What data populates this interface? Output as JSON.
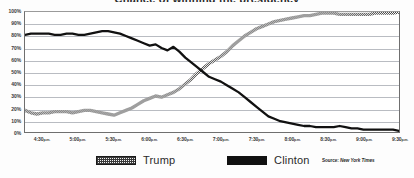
{
  "chart_data": {
    "type": "line",
    "title": "Chance of winning the presidency",
    "xlabel": "",
    "ylabel": "",
    "ylim": [
      0,
      100
    ],
    "ytick_labels": [
      "0%",
      "10%",
      "20%",
      "30%",
      "40%",
      "50%",
      "60%",
      "70%",
      "80%",
      "90%",
      "100%"
    ],
    "ytick_values": [
      0,
      10,
      20,
      30,
      40,
      50,
      60,
      70,
      80,
      90,
      100
    ],
    "grid": true,
    "legend_position": "bottom",
    "xtick_labels": [
      "4:30 p.m.",
      "5:00 p.m.",
      "5:30 p.m.",
      "6:00 p.m.",
      "6:30 p.m.",
      "7:00 p.m.",
      "7:30 p.m.",
      "8:00 p.m.",
      "8:30 p.m.",
      "9:00 p.m.",
      "9:30 p.m."
    ],
    "x": [
      "4:15",
      "4:20",
      "4:25",
      "4:30",
      "4:35",
      "4:40",
      "4:45",
      "4:50",
      "4:55",
      "5:00",
      "5:05",
      "5:10",
      "5:15",
      "5:20",
      "5:25",
      "5:30",
      "5:35",
      "5:40",
      "5:45",
      "5:50",
      "5:55",
      "6:00",
      "6:05",
      "6:10",
      "6:15",
      "6:20",
      "6:25",
      "6:30",
      "6:35",
      "6:40",
      "6:45",
      "6:50",
      "6:55",
      "7:00",
      "7:05",
      "7:10",
      "7:15",
      "7:20",
      "7:25",
      "7:30",
      "7:35",
      "7:40",
      "7:45",
      "7:50",
      "7:55",
      "8:00",
      "8:05",
      "8:10",
      "8:15",
      "8:20",
      "8:25",
      "8:30",
      "8:35",
      "8:40",
      "8:45",
      "8:50",
      "8:55",
      "9:00",
      "9:05",
      "9:10",
      "9:15",
      "9:20",
      "9:25",
      "9:30"
    ],
    "series": [
      {
        "name": "Trump",
        "color": "#555555",
        "style": "dotted-thick",
        "values": [
          18,
          16,
          15,
          16,
          16,
          17,
          17,
          17,
          16,
          17,
          18,
          18,
          17,
          16,
          15,
          14,
          16,
          18,
          20,
          23,
          26,
          28,
          30,
          29,
          31,
          33,
          36,
          40,
          44,
          49,
          53,
          57,
          60,
          63,
          67,
          72,
          76,
          80,
          83,
          86,
          88,
          90,
          92,
          93,
          94,
          95,
          96,
          97,
          97,
          98,
          99,
          99,
          99,
          98,
          98,
          98,
          98,
          98,
          98,
          99,
          99,
          99,
          99,
          100
        ]
      },
      {
        "name": "Clinton",
        "color": "#111111",
        "style": "solid-thick",
        "values": [
          81,
          82,
          82,
          82,
          82,
          81,
          81,
          82,
          82,
          81,
          81,
          82,
          83,
          84,
          84,
          83,
          82,
          80,
          78,
          76,
          74,
          72,
          73,
          70,
          68,
          71,
          67,
          62,
          58,
          54,
          50,
          46,
          44,
          42,
          39,
          36,
          33,
          29,
          25,
          21,
          17,
          13,
          11,
          9,
          8,
          7,
          6,
          5,
          5,
          4,
          4,
          4,
          4,
          5,
          4,
          3,
          3,
          2,
          2,
          2,
          2,
          2,
          2,
          1
        ]
      }
    ],
    "source": "Source: New York Times",
    "source_lead": "Source:",
    "source_name": "New York Times"
  },
  "legend": {
    "items": [
      {
        "label": "Trump",
        "swatch": "dotted-swatch"
      },
      {
        "label": "Clinton",
        "swatch": "solid-swatch"
      }
    ]
  }
}
